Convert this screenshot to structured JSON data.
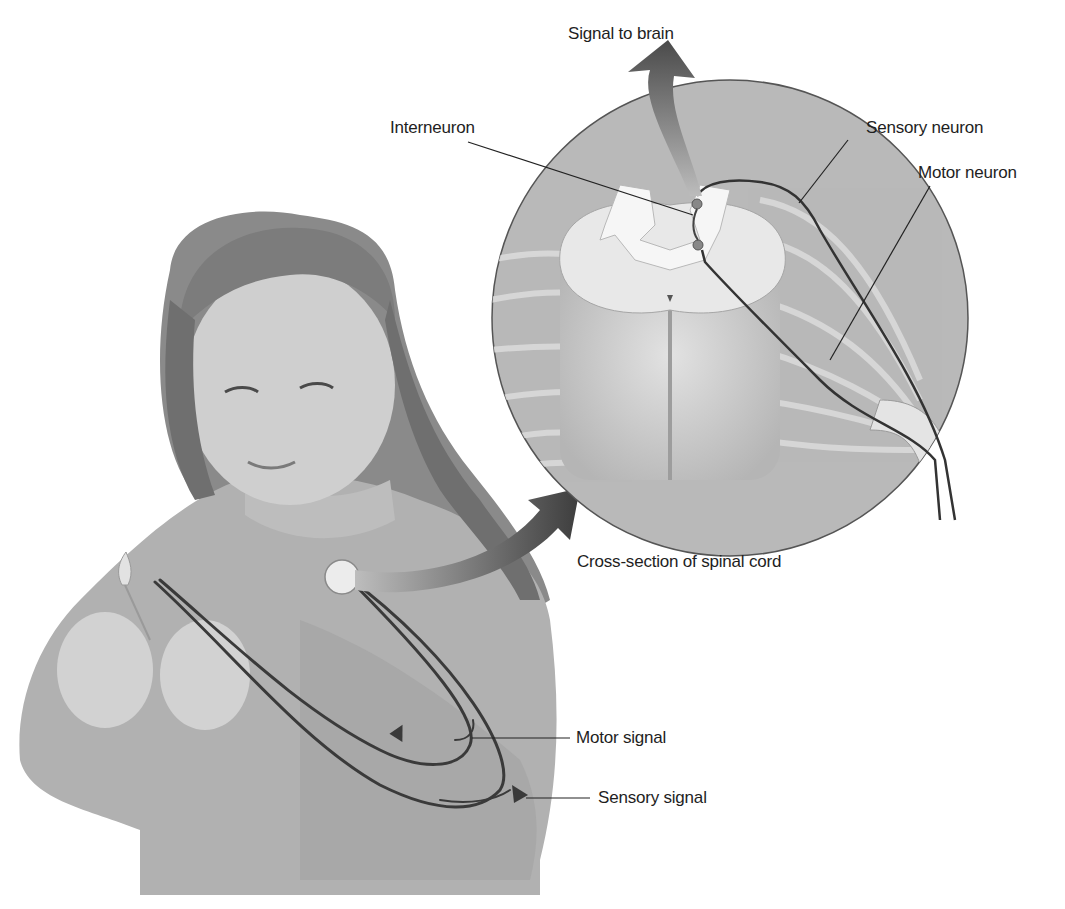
{
  "diagram": {
    "labels": {
      "signal_to_brain": "Signal to brain",
      "interneuron": "Interneuron",
      "sensory_neuron": "Sensory neuron",
      "motor_neuron": "Motor neuron",
      "cross_section": "Cross-section of spinal cord",
      "motor_signal": "Motor signal",
      "sensory_signal": "Sensory signal"
    },
    "colors": {
      "background": "#ffffff",
      "inset_circle": "#b9b9b9",
      "spinal_cord": "#cfcfcf",
      "gray_matter": "#ececec",
      "nerve_line": "#3a3a3a",
      "arrow": "#555555",
      "figure_skin": "#c8c8c8",
      "sweater": "#a9a9a9",
      "hair": "#7a7a7a"
    }
  }
}
